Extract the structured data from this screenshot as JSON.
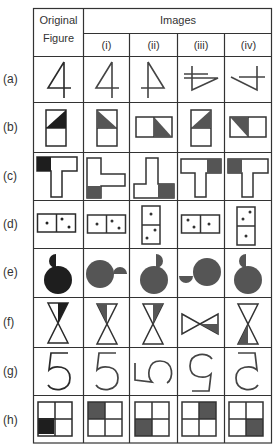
{
  "header": {
    "original_line1": "Original",
    "original_line2": "Figure",
    "images": "Images",
    "columns": [
      "(i)",
      "(ii)",
      "(iii)",
      "(iv)"
    ]
  },
  "rows": [
    {
      "label": "(a)",
      "figure": "digit 4",
      "original": "4 upright",
      "images": [
        "4 upright",
        "4 mirrored",
        "4 rotated",
        "4 rotated mirrored"
      ]
    },
    {
      "label": "(b)",
      "figure": "rectangle with shaded triangle",
      "original": "top square, lower-right triangle shaded",
      "images": [
        "top square, lower-left triangle shaded",
        "horizontal, right square lower-left shaded",
        "top square, lower-right triangle shaded",
        "horizontal, left square upper-right shaded"
      ]
    },
    {
      "label": "(c)",
      "figure": "T shape with shaded corner",
      "original": "T, top-left shaded",
      "images": [
        "L, bottom-left shaded",
        "L mirrored, bottom-right shaded",
        "T, top-right shaded",
        "T, top-left shaded"
      ]
    },
    {
      "label": "(d)",
      "figure": "domino 1-2",
      "original": "horizontal 1 | 2",
      "images": [
        "horizontal 1 | 2",
        "vertical 1 / 2",
        "horizontal 2 | 1",
        "vertical 2 / 1"
      ]
    },
    {
      "label": "(e)",
      "figure": "circle with half-disc",
      "original": "half-disc top-left",
      "images": [
        "half-disc right",
        "half-disc top-right",
        "half-disc left-bottom",
        "half-disc top-left"
      ]
    },
    {
      "label": "(f)",
      "figure": "hourglass with shaded half-triangle",
      "original": "top triangle right half shaded",
      "images": [
        "top triangle left half shaded",
        "top triangle right half shaded",
        "horizontal bowtie, right triangle lower half shaded",
        "bottom triangle left half shaded"
      ]
    },
    {
      "label": "(g)",
      "figure": "digit 5",
      "original": "5 upright",
      "images": [
        "5 upright",
        "5 rotated 90",
        "5 rotated 180",
        "5 mirrored"
      ]
    },
    {
      "label": "(h)",
      "figure": "2x2 grid with one shaded cell",
      "original": "bottom-left shaded",
      "images": [
        "top-left shaded",
        "bottom-left shaded",
        "top-right shaded",
        "bottom-right shaded"
      ]
    }
  ],
  "colors": {
    "ink": "#2a2a2a",
    "original_fill": "#1e1e1e",
    "image_fill": "#555555",
    "grid_line": "#333333"
  }
}
